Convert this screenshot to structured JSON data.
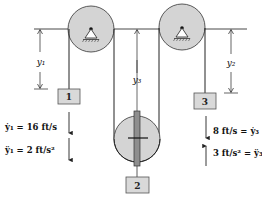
{
  "diagram": {
    "type": "pulley-system",
    "colors": {
      "pulley_fill": "#d4d4d4",
      "block_fill": "#d9d9d9",
      "rod_fill": "#8e8e8e",
      "line": "#222222"
    },
    "pulleys": [
      {
        "id": "left-fixed-pulley",
        "support": "pin"
      },
      {
        "id": "right-fixed-pulley",
        "support": "pin"
      },
      {
        "id": "movable-pulley"
      }
    ],
    "blocks": [
      {
        "id": "block-1",
        "label": "1"
      },
      {
        "id": "block-2",
        "label": "2"
      },
      {
        "id": "block-3",
        "label": "3"
      }
    ],
    "dimensions": {
      "y1": "y₁",
      "y2": "y₂",
      "y3": "y₃"
    },
    "annotations": {
      "left": {
        "velocity": "ẏ₁ = 16 ft/s",
        "acceleration": "ÿ₁ = 2 ft/s²",
        "velocity_direction": "down",
        "acceleration_direction": "down"
      },
      "right": {
        "velocity": "8 ft/s = ẏ₃",
        "acceleration": "3 ft/s² = ÿ₃",
        "velocity_direction": "down",
        "acceleration_direction": "up"
      }
    }
  }
}
